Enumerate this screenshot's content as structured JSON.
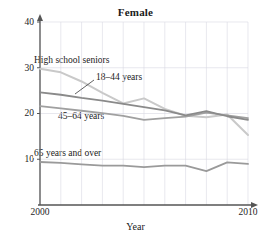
{
  "chart_data": {
    "type": "line",
    "title": "Female",
    "xlabel": "Year",
    "ylabel": "",
    "xlim": [
      2000,
      2010
    ],
    "ylim": [
      0,
      40
    ],
    "yticks": [
      10,
      20,
      30,
      40
    ],
    "xticks": [
      2000,
      2010
    ],
    "grid": true,
    "grid_note": "light vertical gridlines at each year 2000-2010, light horizontal gridlines at 10, 20, 30, 40",
    "legend_position": "inline annotations on plot",
    "x": [
      2000,
      2001,
      2002,
      2003,
      2004,
      2005,
      2006,
      2007,
      2008,
      2009,
      2010
    ],
    "series": [
      {
        "name": "High school seniors",
        "color": "#c9c9c9",
        "values": [
          29.8,
          29.0,
          27.0,
          24.5,
          22.2,
          23.3,
          21.0,
          19.5,
          19.2,
          19.8,
          15.3
        ]
      },
      {
        "name": "18–44 years",
        "color": "#8a8a8a",
        "values": [
          24.6,
          24.1,
          23.4,
          22.8,
          22.1,
          21.4,
          20.7,
          19.6,
          20.5,
          19.4,
          18.6
        ]
      },
      {
        "name": "45–64 years",
        "color": "#a0a0a0",
        "values": [
          21.6,
          21.1,
          20.6,
          20.1,
          19.5,
          18.6,
          19.0,
          19.3,
          20.2,
          19.6,
          19.0
        ]
      },
      {
        "name": "65 years and over",
        "color": "#9a9a9a",
        "values": [
          9.4,
          9.2,
          8.9,
          8.6,
          8.6,
          8.3,
          8.6,
          8.6,
          7.4,
          9.3,
          9.0
        ]
      }
    ],
    "annotations": [
      {
        "text": "High school seniors",
        "x_px": 33,
        "y_px": 56
      },
      {
        "text": "18–44 years",
        "x_px": 95,
        "y_px": 73,
        "leader": true
      },
      {
        "text": "45–64 years",
        "x_px": 57,
        "y_px": 112
      },
      {
        "text": "65 years and over",
        "x_px": 33,
        "y_px": 149
      }
    ],
    "ytick_labels": [
      "10",
      "20",
      "30",
      "40"
    ],
    "xtick_labels": [
      "2000",
      "2010"
    ]
  },
  "axis_color": "#555555",
  "grid_color": "#d9d9e2"
}
